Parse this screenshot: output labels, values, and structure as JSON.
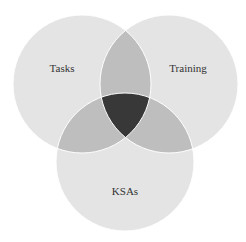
{
  "diagram": {
    "type": "venn-3",
    "sets": [
      {
        "label": "Tasks",
        "cx": 82,
        "cy": 84,
        "r": 69
      },
      {
        "label": "Training",
        "cx": 169,
        "cy": 84,
        "r": 69
      },
      {
        "label": "KSAs",
        "cx": 125,
        "cy": 162,
        "r": 69
      }
    ],
    "colors": {
      "single": "#e4e4e4",
      "pair": "#bebebe",
      "triple": "#383838",
      "stroke": "#ffffff",
      "background": "#ffffff"
    }
  }
}
